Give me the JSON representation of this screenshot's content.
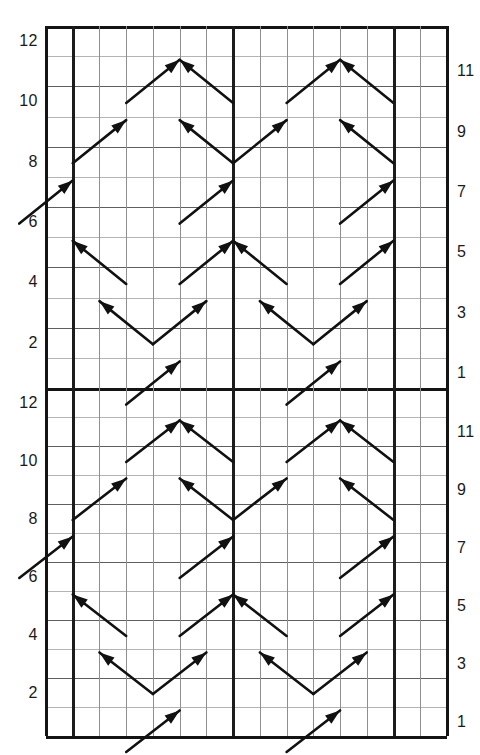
{
  "chart_data": {
    "type": "table",
    "title": "",
    "subtitle": "",
    "xlabel": "",
    "ylabel": "",
    "grid": true,
    "legend_position": "none",
    "columns": 15,
    "rows_per_repeat": 12,
    "repeats": 2,
    "total_rows": 24,
    "bold_column_lines": [
      1,
      7,
      13
    ],
    "left_tick_labels": [
      "12",
      "10",
      "8",
      "6",
      "4",
      "2"
    ],
    "right_tick_labels": [
      "11",
      "9",
      "7",
      "5",
      "3",
      "1"
    ],
    "left_tick_rows": [
      12,
      10,
      8,
      6,
      4,
      2
    ],
    "right_tick_rows": [
      11,
      9,
      7,
      5,
      3,
      1
    ],
    "symbol_rows": [
      1,
      3,
      5,
      7,
      9,
      11
    ],
    "symbols": [
      {
        "row": 11,
        "col_start": 3,
        "col_end": 5,
        "dir": "right-up",
        "label": "cable-right-cross"
      },
      {
        "row": 11,
        "col_start": 7,
        "col_end": 5,
        "dir": "left-up",
        "label": "cable-left-cross"
      },
      {
        "row": 11,
        "col_start": 9,
        "col_end": 11,
        "dir": "right-up",
        "label": "cable-right-cross"
      },
      {
        "row": 11,
        "col_start": 13,
        "col_end": 11,
        "dir": "left-up",
        "label": "cable-left-cross"
      },
      {
        "row": 9,
        "col_start": 1,
        "col_end": 3,
        "dir": "right-up",
        "label": "cable-right-cross"
      },
      {
        "row": 9,
        "col_start": 7,
        "col_end": 5,
        "dir": "left-up",
        "label": "cable-left-cross"
      },
      {
        "row": 9,
        "col_start": 7,
        "col_end": 9,
        "dir": "right-up",
        "label": "cable-right-cross"
      },
      {
        "row": 9,
        "col_start": 13,
        "col_end": 11,
        "dir": "left-up",
        "label": "cable-left-cross"
      },
      {
        "row": 7,
        "col_start": -1,
        "col_end": 1,
        "dir": "right-up",
        "label": "cable-right-cross"
      },
      {
        "row": 7,
        "col_start": 5,
        "col_end": 7,
        "dir": "right-up",
        "label": "cable-right-cross"
      },
      {
        "row": 7,
        "col_start": 11,
        "col_end": 13,
        "dir": "right-up",
        "label": "cable-right-cross"
      },
      {
        "row": 5,
        "col_start": 3,
        "col_end": 1,
        "dir": "left-up",
        "label": "cable-left-cross"
      },
      {
        "row": 5,
        "col_start": 5,
        "col_end": 7,
        "dir": "right-up",
        "label": "cable-right-cross"
      },
      {
        "row": 5,
        "col_start": 9,
        "col_end": 7,
        "dir": "left-up",
        "label": "cable-left-cross"
      },
      {
        "row": 5,
        "col_start": 11,
        "col_end": 13,
        "dir": "right-up",
        "label": "cable-right-cross"
      },
      {
        "row": 3,
        "col_start": 4,
        "col_end": 2,
        "dir": "left-up",
        "label": "cable-left-cross"
      },
      {
        "row": 3,
        "col_start": 4,
        "col_end": 6,
        "dir": "right-up",
        "label": "cable-right-cross"
      },
      {
        "row": 3,
        "col_start": 10,
        "col_end": 8,
        "dir": "left-up",
        "label": "cable-left-cross"
      },
      {
        "row": 3,
        "col_start": 10,
        "col_end": 12,
        "dir": "right-up",
        "label": "cable-right-cross"
      },
      {
        "row": 1,
        "col_start": 3,
        "col_end": 5,
        "dir": "right-up",
        "label": "cable-right-cross"
      },
      {
        "row": 1,
        "col_start": 9,
        "col_end": 11,
        "dir": "right-up",
        "label": "cable-right-cross"
      }
    ]
  },
  "geometry": {
    "grid_left": 46,
    "grid_right": 447,
    "grid_top": 26,
    "grid_mid": 388,
    "grid_bottom": 736,
    "col_width": 26.73,
    "row_height": 30.17,
    "bold_cols": [
      1,
      7,
      13
    ]
  }
}
